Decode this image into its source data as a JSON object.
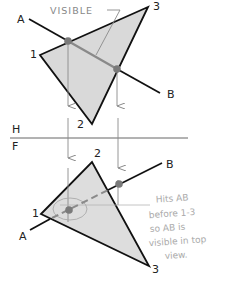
{
  "colors": {
    "plane_fill": "#d9d9d9",
    "edge": "#111111",
    "projection": "#8a8a8a",
    "dot": "#7a7a7a",
    "annotation": "#9a9a9a",
    "handwriting": "#b0b0b0"
  },
  "top_view": {
    "plane_label_1": "1",
    "plane_label_2": "2",
    "plane_label_3": "3",
    "line_label_a": "A",
    "line_label_b": "B",
    "callout": "VISIBLE"
  },
  "fold_line": {
    "upper_label": "H",
    "lower_label": "F"
  },
  "front_view": {
    "plane_label_1": "1",
    "plane_label_2": "2",
    "plane_label_3": "3",
    "line_label_a": "A",
    "line_label_b": "B"
  },
  "handwritten_note": {
    "line1": "Hits AB",
    "line2": "before 1-3",
    "line3": "so AB is",
    "line4": "visible in top",
    "line5": "view."
  }
}
